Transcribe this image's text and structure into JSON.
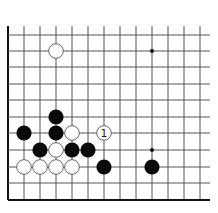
{
  "diagram": {
    "type": "go-board-corner",
    "grid": {
      "x_lines": [
        8,
        24,
        40,
        56,
        72,
        88,
        104,
        120,
        136,
        152,
        168,
        184,
        200
      ],
      "y_lines": [
        3,
        19,
        35,
        51,
        67,
        84,
        100,
        117,
        133,
        150,
        167,
        183,
        200
      ],
      "left_edge": true,
      "bottom_edge": true
    },
    "star_points": [
      {
        "x": 152,
        "y": 51
      },
      {
        "x": 152,
        "y": 150
      }
    ],
    "stones": [
      {
        "color": "white",
        "x": 56,
        "y": 51,
        "label": ""
      },
      {
        "color": "black",
        "x": 56,
        "y": 117,
        "label": ""
      },
      {
        "color": "black",
        "x": 24,
        "y": 133,
        "label": ""
      },
      {
        "color": "black",
        "x": 56,
        "y": 133,
        "label": ""
      },
      {
        "color": "white",
        "x": 72,
        "y": 133,
        "label": ""
      },
      {
        "color": "white",
        "x": 104,
        "y": 133,
        "label": "1"
      },
      {
        "color": "black",
        "x": 40,
        "y": 150,
        "label": ""
      },
      {
        "color": "white",
        "x": 56,
        "y": 150,
        "label": ""
      },
      {
        "color": "black",
        "x": 72,
        "y": 150,
        "label": ""
      },
      {
        "color": "black",
        "x": 88,
        "y": 150,
        "label": ""
      },
      {
        "color": "white",
        "x": 24,
        "y": 167,
        "label": ""
      },
      {
        "color": "white",
        "x": 40,
        "y": 167,
        "label": ""
      },
      {
        "color": "white",
        "x": 56,
        "y": 167,
        "label": ""
      },
      {
        "color": "white",
        "x": 72,
        "y": 167,
        "label": ""
      },
      {
        "color": "black",
        "x": 104,
        "y": 167,
        "label": ""
      },
      {
        "color": "black",
        "x": 152,
        "y": 167,
        "label": ""
      }
    ],
    "colors": {
      "line": "#555555",
      "edge": "#111111",
      "black_stone": "#0a0a0a",
      "white_stone": "#ffffff",
      "white_stroke": "#666666"
    }
  }
}
